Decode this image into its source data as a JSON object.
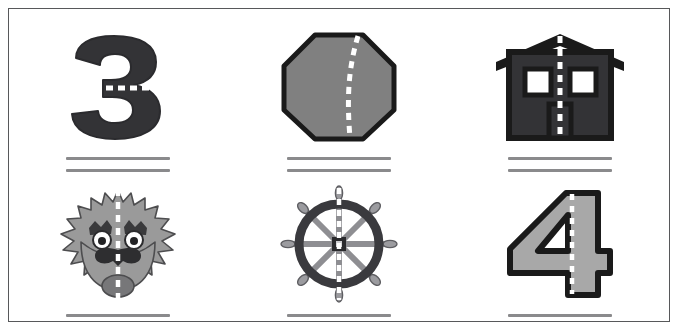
{
  "worksheet": {
    "title": "Lines of Symmetry Worksheet",
    "frame_color": "#57585a",
    "background": "#ffffff",
    "answer_line_color": "#8a8a8c",
    "dash_color": "#ffffff",
    "rows": 2,
    "columns": 3
  },
  "palette": {
    "dark": "#333336",
    "mid_gray": "#808080",
    "light_gray": "#a8a8a8",
    "outline": "#1a1a1a",
    "white": "#ffffff",
    "wheel_ring": "#3a3a3e",
    "wheel_spoke": "#8e8e92"
  },
  "cells": [
    {
      "id": "cell-1",
      "position": "row1-col1",
      "figure_name": "numeral-three",
      "figure_label": "3",
      "fill": "#333336",
      "dash_orientation": "horizontal",
      "dash_is_symmetry_line": true,
      "answer_value": "",
      "answer_placeholder": ""
    },
    {
      "id": "cell-2",
      "position": "row1-col2",
      "figure_name": "octagon",
      "figure_label": "octagon",
      "fill": "#808080",
      "dash_orientation": "vertical-offset-curved",
      "dash_is_symmetry_line": false,
      "answer_value": "",
      "answer_placeholder": ""
    },
    {
      "id": "cell-3",
      "position": "row1-col3",
      "figure_name": "house",
      "figure_label": "house",
      "fill": "#333336",
      "dash_orientation": "vertical",
      "dash_is_symmetry_line": true,
      "answer_value": "",
      "answer_placeholder": ""
    },
    {
      "id": "cell-4",
      "position": "row2-col1",
      "figure_name": "dog-face",
      "figure_label": "dog face",
      "fill": "#9a9a9a",
      "dash_orientation": "vertical",
      "dash_is_symmetry_line": true,
      "answer_value": "",
      "answer_placeholder": ""
    },
    {
      "id": "cell-5",
      "position": "row2-col2",
      "figure_name": "ships-wheel",
      "figure_label": "ship's wheel",
      "fill": "#3a3a3e",
      "dash_orientation": "vertical",
      "dash_is_symmetry_line": true,
      "answer_value": "",
      "answer_placeholder": ""
    },
    {
      "id": "cell-6",
      "position": "row2-col3",
      "figure_name": "numeral-four",
      "figure_label": "4",
      "fill": "#a8a8a8",
      "dash_orientation": "vertical",
      "dash_is_symmetry_line": true,
      "answer_value": "",
      "answer_placeholder": ""
    }
  ]
}
